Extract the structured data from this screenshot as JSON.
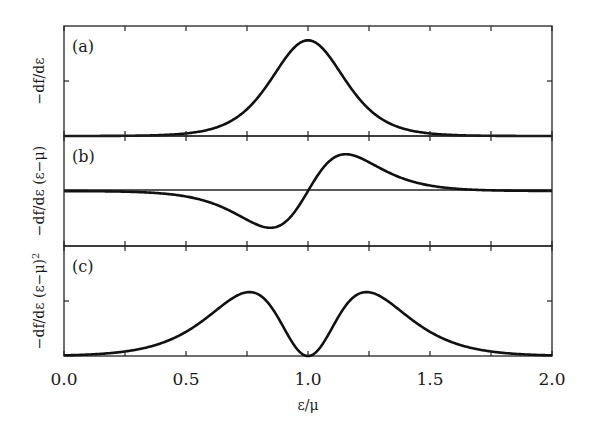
{
  "chart_data": {
    "type": "line",
    "layout": "three vertically stacked panels sharing x-axis",
    "xlabel": "ε/μ",
    "xlim": [
      0.0,
      2.0
    ],
    "x_ticks": [
      "0.0",
      "0.5",
      "1.0",
      "1.5",
      "2.0"
    ],
    "x_minor_ticks": [
      0.25,
      0.75,
      1.25,
      1.75
    ],
    "grid": false,
    "legend": null,
    "line_color": "#111111",
    "panels": [
      {
        "id": "a",
        "panel_label": "(a)",
        "ylabel": "−df/dε",
        "description": "single peak centered at ε/μ = 1.0",
        "ylim": [
          0,
          1.15
        ],
        "series": [
          {
            "name": "-df/dε",
            "x": [
              0.0,
              0.25,
              0.5,
              0.6,
              0.7,
              0.8,
              0.9,
              1.0,
              1.1,
              1.2,
              1.3,
              1.4,
              1.5,
              1.75,
              2.0
            ],
            "y": [
              0.0,
              0.002,
              0.03,
              0.07,
              0.18,
              0.4,
              0.79,
              1.0,
              0.79,
              0.4,
              0.18,
              0.07,
              0.03,
              0.002,
              0.0
            ]
          }
        ]
      },
      {
        "id": "b",
        "panel_label": "(b)",
        "ylabel": "−df/dε (ε−μ)",
        "description": "antisymmetric curve; minimum near 0.84, zero crossing at 1.0, maximum near 1.16; horizontal zero line drawn",
        "ylim": [
          -1.0,
          1.0
        ],
        "zero_line": true,
        "series": [
          {
            "name": "-df/dε (ε-μ)",
            "x": [
              0.0,
              0.25,
              0.5,
              0.6,
              0.7,
              0.8,
              0.84,
              0.9,
              1.0,
              1.1,
              1.16,
              1.2,
              1.3,
              1.4,
              1.5,
              1.75,
              2.0
            ],
            "y": [
              0.0,
              -0.01,
              -0.1,
              -0.21,
              -0.42,
              -0.78,
              -0.85,
              -0.61,
              0.0,
              0.61,
              0.85,
              0.78,
              0.42,
              0.21,
              0.1,
              0.01,
              0.0
            ]
          }
        ]
      },
      {
        "id": "c",
        "panel_label": "(c)",
        "ylabel": "−df/dε (ε−μ)²",
        "description": "symmetric double peak; maxima near 0.77 and 1.23, zero at 1.0",
        "ylim": [
          0,
          1.55
        ],
        "series": [
          {
            "name": "-df/dε (ε-μ)^2",
            "x": [
              0.0,
              0.25,
              0.5,
              0.6,
              0.7,
              0.77,
              0.85,
              0.9,
              1.0,
              1.1,
              1.15,
              1.23,
              1.3,
              1.4,
              1.5,
              1.75,
              2.0
            ],
            "y": [
              0.0,
              0.04,
              0.32,
              0.55,
              0.86,
              0.93,
              0.73,
              0.44,
              0.0,
              0.44,
              0.73,
              0.93,
              0.86,
              0.55,
              0.32,
              0.04,
              0.0
            ]
          }
        ]
      }
    ],
    "model": {
      "mu": 1.0,
      "kT": 0.1
    }
  }
}
